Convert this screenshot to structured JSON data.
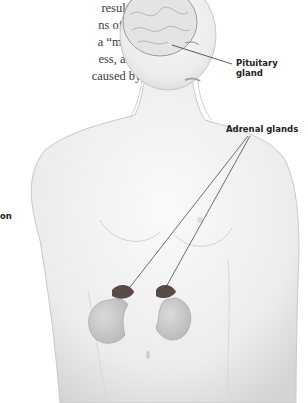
{
  "text_fragment": {
    "lines": [
      "result in",
      "ns of this",
      "a “moon”",
      "ess, and",
      "caused by a"
    ]
  },
  "labels": {
    "pituitary": [
      "Pituitary",
      "gland"
    ],
    "adrenal": "Adrenal glands",
    "cutoff": "on"
  },
  "figure": {
    "organs": [
      "brain",
      "pituitary-gland",
      "adrenal-glands",
      "kidneys"
    ],
    "colors": {
      "skin": "#ececec",
      "shadow": "#c8c8c8",
      "kidney": "#cfcfcf",
      "adrenal": "#5a4a46",
      "line": "#333333"
    }
  }
}
